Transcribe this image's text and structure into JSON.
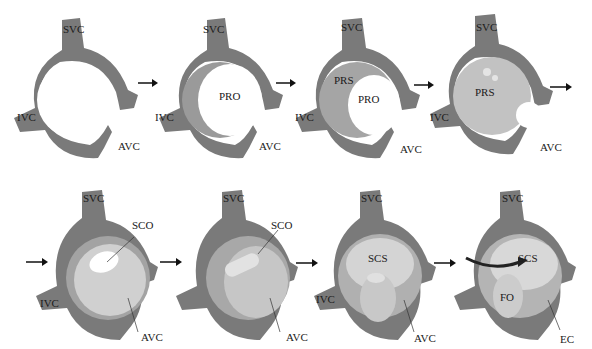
{
  "figure": {
    "colors": {
      "wall": "#7a7a7a",
      "wall_dark": "#5a5a5a",
      "septum": "#b8b8b8",
      "septum_light": "#d6d6d6",
      "label": "#1a1a1a",
      "background": "#ffffff"
    },
    "rows": [
      {
        "panels": [
          {
            "step": 1,
            "labels": {
              "svc": "SVC",
              "ivc": "IVC",
              "avc": "AVC"
            }
          },
          {
            "step": 2,
            "labels": {
              "svc": "SVC",
              "ivc": "IVC",
              "avc": "AVC",
              "center": "PRO"
            }
          },
          {
            "step": 3,
            "labels": {
              "svc": "SVC",
              "ivc": "IVC",
              "avc": "AVC",
              "upper": "PRS",
              "center": "PRO"
            }
          },
          {
            "step": 4,
            "labels": {
              "svc": "SVC",
              "ivc": "IVC",
              "avc": "AVC",
              "center": "PRS"
            }
          }
        ]
      },
      {
        "panels": [
          {
            "step": 5,
            "labels": {
              "svc": "SVC",
              "ivc": "IVC",
              "avc": "AVC",
              "pointer": "SCO"
            }
          },
          {
            "step": 6,
            "labels": {
              "svc": "SVC",
              "avc": "AVC",
              "pointer": "SCO"
            }
          },
          {
            "step": 7,
            "labels": {
              "svc": "SVC",
              "ivc": "IVC",
              "avc": "AVC",
              "center": "SCS"
            }
          },
          {
            "step": 8,
            "labels": {
              "svc": "SVC",
              "ec": "EC",
              "center": "SCS",
              "lower": "FO"
            }
          }
        ]
      }
    ],
    "arrow_glyph": "→"
  }
}
